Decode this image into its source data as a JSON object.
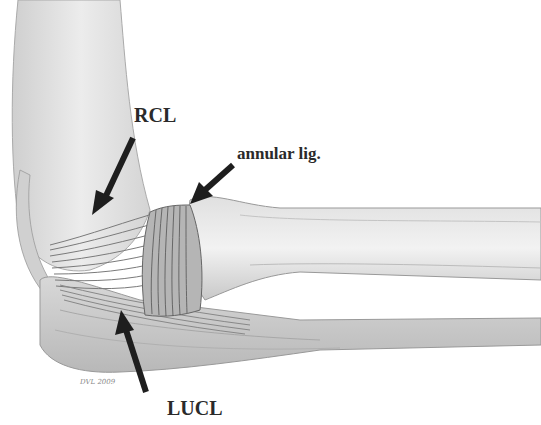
{
  "figure": {
    "labels": {
      "rcl": "RCL",
      "annular": "annular lig.",
      "lucl": "LUCL"
    },
    "signature": "DVL 2009",
    "colors": {
      "background": "#ffffff",
      "bone_light": "#e6e6e6",
      "bone_shade": "#bdbdbd",
      "ligament": "#9a9a9a",
      "arrow": "#1e1e1e",
      "label_text": "#2a2a2a"
    }
  }
}
